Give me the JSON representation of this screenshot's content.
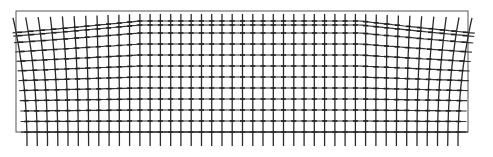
{
  "figure": {
    "description": "Deformed rectangular grid (vector/mesh deformation plot)",
    "colors": {
      "background": "#ffffff",
      "line": "#2a2a2a",
      "border": "#555555"
    },
    "frame": {
      "x0": 16,
      "y0": 11,
      "x1": 468,
      "y1": 132
    },
    "bottom_line": {
      "x0": 27,
      "x1": 468,
      "y": 132
    },
    "grid": {
      "columns": 43,
      "x_start": 27,
      "x_end": 458,
      "top_y": 14,
      "bottom_y": 146,
      "row_y": [
        21,
        25,
        33,
        44,
        55,
        66,
        77,
        88,
        99,
        110,
        121,
        132
      ],
      "distortion": {
        "left_zone_end": 140,
        "right_zone_start": 360,
        "max_shift": 14
      }
    }
  }
}
